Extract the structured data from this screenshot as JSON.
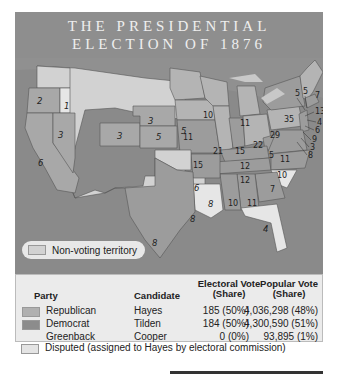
{
  "title": {
    "line1": "THE PRESIDENTIAL",
    "line2": "ELECTION OF 1876"
  },
  "colors": {
    "background": "#8a8a8a",
    "republican": "#b0b0b0",
    "democrat": "#9a9a9a",
    "disputed": "#e4e4e4",
    "non_voting": "#d2d2d2"
  },
  "map": {
    "state_labels": [
      {
        "state": "Oregon",
        "votes": "2",
        "party": "republican"
      },
      {
        "state": "Oregon (disputed)",
        "votes": "1",
        "party": "disputed"
      },
      {
        "state": "California",
        "votes": "6",
        "party": "republican"
      },
      {
        "state": "Nevada",
        "votes": "3",
        "party": "republican"
      },
      {
        "state": "Colorado",
        "votes": "3",
        "party": "republican"
      },
      {
        "state": "Nebraska",
        "votes": "3",
        "party": "republican"
      },
      {
        "state": "Kansas",
        "votes": "5",
        "party": "republican"
      },
      {
        "state": "Minnesota",
        "votes": "5",
        "party": "republican"
      },
      {
        "state": "Iowa",
        "votes": "11",
        "party": "republican"
      },
      {
        "state": "Missouri",
        "votes": "15",
        "party": "democrat"
      },
      {
        "state": "Wisconsin",
        "votes": "10",
        "party": "republican"
      },
      {
        "state": "Illinois",
        "votes": "21",
        "party": "republican"
      },
      {
        "state": "Michigan",
        "votes": "11",
        "party": "republican"
      },
      {
        "state": "Indiana",
        "votes": "15",
        "party": "democrat"
      },
      {
        "state": "Ohio",
        "votes": "22",
        "party": "republican"
      },
      {
        "state": "West Virginia",
        "votes": "5",
        "party": "democrat"
      },
      {
        "state": "Virginia",
        "votes": "11",
        "party": "democrat"
      },
      {
        "state": "Kentucky",
        "votes": "12",
        "party": "democrat"
      },
      {
        "state": "Tennessee",
        "votes": "12",
        "party": "democrat"
      },
      {
        "state": "North Carolina",
        "votes": "10",
        "party": "democrat"
      },
      {
        "state": "South Carolina",
        "votes": "7",
        "party": "disputed"
      },
      {
        "state": "Georgia",
        "votes": "11",
        "party": "democrat"
      },
      {
        "state": "Alabama",
        "votes": "10",
        "party": "democrat"
      },
      {
        "state": "Mississippi",
        "votes": "8",
        "party": "democrat"
      },
      {
        "state": "Louisiana",
        "votes": "8",
        "party": "disputed"
      },
      {
        "state": "Florida",
        "votes": "4",
        "party": "disputed"
      },
      {
        "state": "Arkansas",
        "votes": "6",
        "party": "democrat"
      },
      {
        "state": "Texas",
        "votes": "8",
        "party": "democrat"
      },
      {
        "state": "Pennsylvania",
        "votes": "29",
        "party": "republican"
      },
      {
        "state": "New York",
        "votes": "35",
        "party": "democrat"
      },
      {
        "state": "Vermont",
        "votes": "5",
        "party": "republican"
      },
      {
        "state": "New Hampshire",
        "votes": "5",
        "party": "republican"
      },
      {
        "state": "Maine",
        "votes": "7",
        "party": "republican"
      },
      {
        "state": "Massachusetts",
        "votes": "13",
        "party": "republican"
      },
      {
        "state": "Rhode Island",
        "votes": "4",
        "party": "republican"
      },
      {
        "state": "Connecticut",
        "votes": "6",
        "party": "democrat"
      },
      {
        "state": "New Jersey",
        "votes": "9",
        "party": "democrat"
      },
      {
        "state": "Delaware",
        "votes": "3",
        "party": "democrat"
      },
      {
        "state": "Maryland",
        "votes": "8",
        "party": "democrat"
      }
    ],
    "legend_label": "Non-voting territory"
  },
  "table": {
    "headers": {
      "party": "Party",
      "candidate": "Candidate",
      "electoral_1": "Electoral Vote",
      "electoral_2": "(Share)",
      "popular_1": "Popular Vote",
      "popular_2": "(Share)"
    },
    "rows": [
      {
        "party": "Republican",
        "candidate": "Hayes",
        "electoral": "185 (50%)",
        "popular": "4,036,298 (48%)"
      },
      {
        "party": "Democrat",
        "candidate": "Tilden",
        "electoral": "184 (50%)",
        "popular": "4,300,590 (51%)"
      },
      {
        "party": "Greenback",
        "candidate": "Cooper",
        "electoral": "0 (0%)",
        "popular": "93,895 (1%)"
      }
    ],
    "disputed_note": "Disputed (assigned to Hayes by electoral commission)"
  }
}
